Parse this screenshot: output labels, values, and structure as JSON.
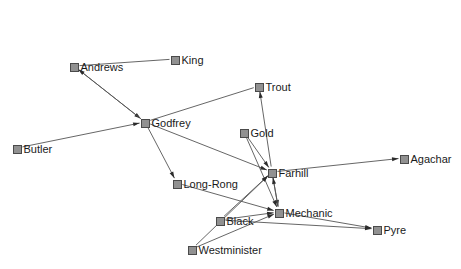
{
  "diagram": {
    "width": 461,
    "height": 269,
    "background_color": "#ffffff",
    "node_fill_color": "#919191",
    "node_border_color": "#4a4a4a",
    "edge_color": "#555555",
    "label_color": "#1a1a1a",
    "node_size": 9
  },
  "nodes": [
    {
      "id": "andrews",
      "label": "Andrews",
      "x": 74,
      "y": 66
    },
    {
      "id": "king",
      "label": "King",
      "x": 175,
      "y": 59
    },
    {
      "id": "trout",
      "label": "Trout",
      "x": 259,
      "y": 86
    },
    {
      "id": "godfrey",
      "label": "Godfrey",
      "x": 145,
      "y": 122
    },
    {
      "id": "gold",
      "label": "Gold",
      "x": 244,
      "y": 132
    },
    {
      "id": "butler",
      "label": "Butler",
      "x": 17,
      "y": 148
    },
    {
      "id": "farhill",
      "label": "Farhill",
      "x": 272,
      "y": 172
    },
    {
      "id": "agachar",
      "label": "Agachar",
      "x": 404,
      "y": 158
    },
    {
      "id": "long-rong",
      "label": "Long-Rong",
      "x": 177,
      "y": 183
    },
    {
      "id": "mechanic",
      "label": "Mechanic",
      "x": 279,
      "y": 212
    },
    {
      "id": "black",
      "label": "Black",
      "x": 220,
      "y": 220
    },
    {
      "id": "pyre",
      "label": "Pyre",
      "x": 377,
      "y": 229
    },
    {
      "id": "westminister",
      "label": "Westminister",
      "x": 192,
      "y": 249
    }
  ],
  "edges": [
    {
      "from": "andrews",
      "to": "king",
      "directed": false,
      "label": "Andrews - King"
    },
    {
      "from": "andrews",
      "to": "godfrey",
      "directed": true,
      "label": "Andrews to Godfrey"
    },
    {
      "from": "godfrey",
      "to": "andrews",
      "directed": true,
      "label": "Godfrey to Andrews"
    },
    {
      "from": "butler",
      "to": "godfrey",
      "directed": true,
      "label": "Butler to Godfrey"
    },
    {
      "from": "godfrey",
      "to": "trout",
      "directed": false,
      "label": "Godfrey - Trout"
    },
    {
      "from": "godfrey",
      "to": "farhill",
      "directed": true,
      "label": "Godfrey to Farhill"
    },
    {
      "from": "godfrey",
      "to": "long-rong",
      "directed": true,
      "label": "Godfrey to Long-Rong"
    },
    {
      "from": "farhill",
      "to": "trout",
      "directed": true,
      "label": "Farhill to Trout"
    },
    {
      "from": "gold",
      "to": "farhill",
      "directed": true,
      "label": "Gold to Farhill"
    },
    {
      "from": "gold",
      "to": "mechanic",
      "directed": true,
      "label": "Gold to Mechanic"
    },
    {
      "from": "farhill",
      "to": "agachar",
      "directed": true,
      "label": "Farhill to Agachar"
    },
    {
      "from": "farhill",
      "to": "mechanic",
      "directed": true,
      "label": "Farhill to Mechanic"
    },
    {
      "from": "mechanic",
      "to": "farhill",
      "directed": true,
      "label": "Mechanic to Farhill"
    },
    {
      "from": "long-rong",
      "to": "mechanic",
      "directed": true,
      "label": "Long-Rong to Mechanic"
    },
    {
      "from": "black",
      "to": "farhill",
      "directed": true,
      "label": "Black to Farhill"
    },
    {
      "from": "black",
      "to": "mechanic",
      "directed": true,
      "label": "Black to Mechanic"
    },
    {
      "from": "westminister",
      "to": "farhill",
      "directed": true,
      "label": "Westminister to Farhill"
    },
    {
      "from": "westminister",
      "to": "mechanic",
      "directed": true,
      "label": "Westminister to Mechanic"
    },
    {
      "from": "mechanic",
      "to": "pyre",
      "directed": true,
      "label": "Mechanic to Pyre"
    },
    {
      "from": "black",
      "to": "pyre",
      "directed": true,
      "label": "Black to Pyre"
    }
  ]
}
